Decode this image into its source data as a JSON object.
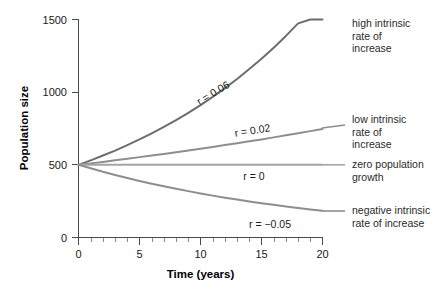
{
  "chart_data": {
    "type": "line",
    "title": "",
    "xlabel": "Time (years)",
    "ylabel": "Population size",
    "xlim": [
      0,
      20
    ],
    "ylim": [
      0,
      1500
    ],
    "grid": false,
    "legend_position": "right-inline",
    "x_ticks": [
      "0",
      "5",
      "10",
      "15",
      "20"
    ],
    "x_tick_values": [
      0,
      5,
      10,
      15,
      20
    ],
    "x_minor_tick_values": [
      1,
      2,
      3,
      4,
      6,
      7,
      8,
      9,
      11,
      12,
      13,
      14,
      16,
      17,
      18,
      19
    ],
    "y_ticks": [
      "0",
      "500",
      "1000",
      "1500"
    ],
    "y_tick_values": [
      0,
      500,
      1000,
      1500
    ],
    "initial_population": 500,
    "x": [
      0,
      1,
      2,
      3,
      4,
      5,
      6,
      7,
      8,
      9,
      10,
      11,
      12,
      13,
      14,
      15,
      16,
      17,
      18,
      19,
      20
    ],
    "series": [
      {
        "name": "high intrinsic rate of increase",
        "r": 0.06,
        "annotation": "r = 0.06",
        "color": "#6d6d6d",
        "linewidth": 2.0,
        "values": [
          500,
          531,
          564,
          598,
          636,
          675,
          717,
          761,
          808,
          858,
          911,
          968,
          1028,
          1091,
          1159,
          1230,
          1306,
          1387,
          1473,
          1564,
          1660
        ]
      },
      {
        "name": "low intrinsic rate of increase",
        "r": 0.02,
        "annotation": "r = 0.02",
        "color": "#8e8e8e",
        "linewidth": 2.0,
        "values": [
          500,
          510,
          520,
          531,
          542,
          553,
          564,
          575,
          586,
          598,
          611,
          623,
          636,
          648,
          662,
          675,
          689,
          703,
          717,
          732,
          746
        ]
      },
      {
        "name": "zero population growth",
        "r": 0,
        "annotation": "r = 0",
        "color": "#a5a5a5",
        "linewidth": 2.0,
        "values": [
          500,
          500,
          500,
          500,
          500,
          500,
          500,
          500,
          500,
          500,
          500,
          500,
          500,
          500,
          500,
          500,
          500,
          500,
          500,
          500,
          500
        ]
      },
      {
        "name": "negative intrinsic rate of increase",
        "r": -0.05,
        "annotation": "r = −0.05",
        "color": "#8e8e8e",
        "linewidth": 2.0,
        "values": [
          500,
          476,
          452,
          430,
          409,
          389,
          370,
          352,
          335,
          319,
          303,
          288,
          274,
          261,
          248,
          236,
          225,
          214,
          203,
          193,
          184
        ]
      }
    ],
    "annotations": [
      {
        "text": "r = 0.06",
        "x": 11.2,
        "y": 1020,
        "rotation": -31
      },
      {
        "text": "r = 0.02",
        "x": 12.0,
        "y": 690,
        "rotation": -8
      },
      {
        "text": "r = 0",
        "x": 12.6,
        "y": 430,
        "rotation": 0
      },
      {
        "text": "r = −0.05",
        "x": 13.6,
        "y": 250,
        "rotation": 0
      }
    ],
    "legend_labels": [
      {
        "text": "high intrinsic\nrate of increase",
        "series": "high intrinsic rate of increase"
      },
      {
        "text": "low intrinsic\nrate of increase",
        "series": "low intrinsic rate of increase"
      },
      {
        "text": "zero population\ngrowth",
        "series": "zero population growth"
      },
      {
        "text": "negative intrinsic\nrate of increase",
        "series": "negative intrinsic rate of increase"
      }
    ]
  },
  "axes": {
    "x_title": "Time (years)",
    "y_title": "Population size",
    "x_tick_labels": [
      "0",
      "5",
      "10",
      "15",
      "20"
    ],
    "y_tick_labels": [
      "0",
      "500",
      "1000",
      "1500"
    ]
  },
  "annotations": {
    "r006": "r = 0.06",
    "r002": "r = 0.02",
    "r000": "r = 0",
    "rneg005": "r = −0.05"
  },
  "legend": {
    "high": "high intrinsic\nrate of\nincrease",
    "low": "low intrinsic\nrate of\nincrease",
    "zero": "zero population\ngrowth",
    "negative": "negative intrinsic\nrate of increase"
  },
  "colors": {
    "curve_high": "#6d6d6d",
    "curve_low": "#8e8e8e",
    "curve_zero": "#a5a5a5",
    "curve_negative": "#8e8e8e",
    "axis": "#4a4a4a",
    "text": "#1a1a1a",
    "background": "#ffffff"
  }
}
